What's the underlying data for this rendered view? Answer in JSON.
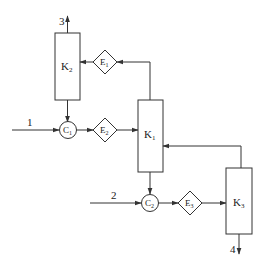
{
  "diagram": {
    "type": "process flow",
    "colors": {
      "line": "#333333",
      "background": "#ffffff"
    },
    "nodes": {
      "K1": {
        "label": "K",
        "sub": "1",
        "shape": "rectangle"
      },
      "K2": {
        "label": "K",
        "sub": "2",
        "shape": "rectangle"
      },
      "K3": {
        "label": "K",
        "sub": "3",
        "shape": "rectangle"
      },
      "C1": {
        "label": "C",
        "sub": "1",
        "shape": "circle"
      },
      "C2": {
        "label": "C",
        "sub": "2",
        "shape": "circle"
      },
      "E1": {
        "label": "E",
        "sub": "1",
        "shape": "diamond"
      },
      "E2": {
        "label": "E",
        "sub": "2",
        "shape": "diamond"
      },
      "E3": {
        "label": "E",
        "sub": "3",
        "shape": "diamond"
      }
    },
    "streams": {
      "s1": "1",
      "s2": "2",
      "s3": "3",
      "s4": "4"
    },
    "edges": [
      {
        "from": "stream 1",
        "to": "C1"
      },
      {
        "from": "K2",
        "to": "C1"
      },
      {
        "from": "C1",
        "to": "E2"
      },
      {
        "from": "E2",
        "to": "K1"
      },
      {
        "from": "K1",
        "to": "E1"
      },
      {
        "from": "E1",
        "to": "K2"
      },
      {
        "from": "K2",
        "to": "stream 3"
      },
      {
        "from": "K1",
        "to": "C2"
      },
      {
        "from": "stream 2",
        "to": "C2"
      },
      {
        "from": "C2",
        "to": "E3"
      },
      {
        "from": "E3",
        "to": "K3"
      },
      {
        "from": "K3",
        "to": "K1"
      },
      {
        "from": "K3",
        "to": "stream 4"
      }
    ]
  }
}
